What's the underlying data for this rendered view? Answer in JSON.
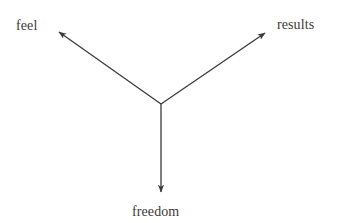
{
  "canvas": {
    "width": 342,
    "height": 223,
    "background_color": "#ffffff"
  },
  "style": {
    "stroke_color": "#3a3a3a",
    "stroke_width": 1.3,
    "text_color": "#3d3a38",
    "font_size_px": 14
  },
  "diagram": {
    "type": "radial-arrow-diagram",
    "center": {
      "x": 161,
      "y": 104
    },
    "arrows": [
      {
        "id": "arrow-feel",
        "direction": "upper-left",
        "from": {
          "x": 161,
          "y": 104
        },
        "to": {
          "x": 57,
          "y": 30
        },
        "arrowhead_at": "to"
      },
      {
        "id": "arrow-results",
        "direction": "upper-right",
        "from": {
          "x": 161,
          "y": 104
        },
        "to": {
          "x": 267,
          "y": 31
        },
        "arrowhead_at": "to"
      },
      {
        "id": "arrow-freedom",
        "direction": "down",
        "from": {
          "x": 161,
          "y": 104
        },
        "to": {
          "x": 161,
          "y": 195
        },
        "arrowhead_at": "to"
      }
    ],
    "labels": [
      {
        "id": "label-feel",
        "text": "feel",
        "position": "top-left"
      },
      {
        "id": "label-results",
        "text": "results",
        "position": "top-right"
      },
      {
        "id": "label-freedom",
        "text": "freedom",
        "position": "bottom-center"
      }
    ]
  }
}
